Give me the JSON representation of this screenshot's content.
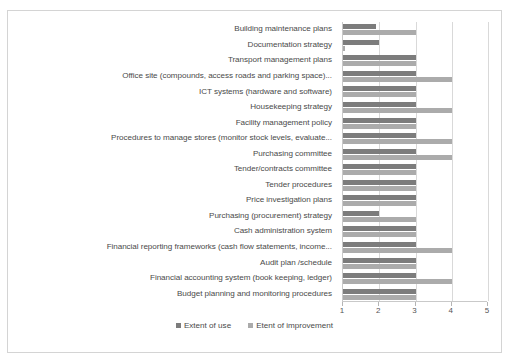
{
  "chart_data": {
    "type": "bar",
    "orientation": "horizontal",
    "title": "",
    "xlabel": "",
    "ylabel": "",
    "xlim": [
      1,
      5
    ],
    "xticks": [
      1,
      2,
      3,
      4,
      5
    ],
    "xtick_labels": [
      "1",
      "2",
      "3",
      "4",
      "5"
    ],
    "grid": true,
    "legend_position": "bottom",
    "categories": [
      "Building maintenance plans",
      "Documentation strategy",
      "Transport management plans",
      "Office site (compounds, access roads and parking space)...",
      "ICT systems (hardware and software)",
      "Housekeeping strategy",
      "Facility management policy",
      "Procedures to manage stores (monitor stock levels, evaluate...",
      "Purchasing committee",
      "Tender/contracts committee",
      "Tender procedures",
      "Price investigation plans",
      "Purchasing (procurement) strategy",
      "Cash administration system",
      "Financial reporting frameworks (cash flow statements, income...",
      "Audit plan /schedule",
      "Financial accounting system (book keeping, ledger)",
      "Budget planning and monitoring procedures"
    ],
    "series": [
      {
        "name": "Extent of use",
        "color": "#7c7c7c",
        "values": [
          1.9,
          2.0,
          3.0,
          3.0,
          3.0,
          3.0,
          3.0,
          3.0,
          3.0,
          3.0,
          3.0,
          3.0,
          2.0,
          3.0,
          3.0,
          3.0,
          3.0,
          3.0
        ]
      },
      {
        "name": "Etent of improvement",
        "color": "#ababab",
        "values": [
          3.0,
          1.05,
          3.0,
          4.0,
          3.0,
          4.0,
          3.0,
          4.0,
          4.0,
          3.0,
          3.0,
          3.0,
          3.0,
          3.0,
          4.0,
          3.0,
          4.0,
          3.0
        ]
      }
    ]
  },
  "legend": {
    "items": [
      {
        "label": "Extent of use"
      },
      {
        "label": "Etent of improvement"
      }
    ]
  }
}
